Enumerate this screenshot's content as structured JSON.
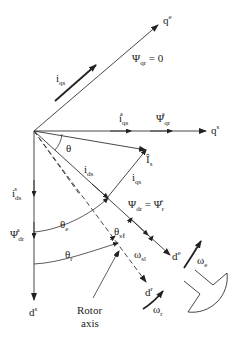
{
  "diagram": {
    "axes": {
      "qe": "q",
      "qe_sup": "e",
      "qs": "q",
      "qs_sup": "s",
      "ds": "d",
      "ds_sup": "s",
      "de": "d",
      "de_sup": "e",
      "dr": "d",
      "dr_sup": "r"
    },
    "labels": {
      "iqs_main": "i",
      "iqs_main_sub": "qs",
      "psi_qr_zero": "Ψ",
      "psi_qr_zero_sub": "qr",
      "psi_qr_zero_rhs": " = 0",
      "iqs_s": "i",
      "iqs_s_sub": "qs",
      "iqs_s_sup": "s",
      "psi_qr_s": "Ψ",
      "psi_qr_s_sub": "qr",
      "psi_qr_s_sup": "s",
      "theta": "θ",
      "Is_hat": "Î",
      "Is_hat_sub": "s",
      "ids": "i",
      "ids_sub": "ds",
      "iqs": "i",
      "iqs_sub": "qs",
      "ids_s": "i",
      "ids_s_sub": "ds",
      "ids_s_sup": "s",
      "psi_dr_s": "Ψ",
      "psi_dr_s_sub": "dr",
      "psi_dr_s_sup": "s",
      "psi_dr_eq": "Ψ",
      "psi_dr_eq_sub": "dr",
      "psi_dr_eq_rhs": " = Ψ̂",
      "psi_dr_eq_rhs_sub": "r",
      "theta_e": "θ",
      "theta_e_sub": "e",
      "theta_r": "θ",
      "theta_r_sub": "r",
      "theta_sl": "θ",
      "theta_sl_sub": "sℓ",
      "omega_sl": "ω",
      "omega_sl_sub": "sl",
      "omega_e": "ω",
      "omega_e_sub": "e",
      "omega_r": "ω",
      "omega_r_sub": "r",
      "rotor_axis_line1": "Rotor",
      "rotor_axis_line2": "axis"
    }
  }
}
